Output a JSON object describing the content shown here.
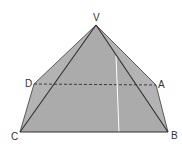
{
  "diagram": {
    "type": "pyramid-solid",
    "colors": {
      "fill": "#b3b3b3",
      "fill_dark": "#a8a8a8",
      "edge": "#3a3a3a",
      "highlight": "#ffffff"
    },
    "vertices": {
      "V": {
        "label": "V",
        "x": 96,
        "y": 25
      },
      "D": {
        "label": "D",
        "x": 34,
        "y": 84
      },
      "A": {
        "label": "A",
        "x": 156,
        "y": 85
      },
      "C": {
        "label": "C",
        "x": 20,
        "y": 132
      },
      "B": {
        "label": "B",
        "x": 168,
        "y": 132
      }
    },
    "labels": [
      {
        "text": "V",
        "x": 93,
        "y": 21
      },
      {
        "text": "D",
        "x": 25,
        "y": 87
      },
      {
        "text": "A",
        "x": 158,
        "y": 88
      },
      {
        "text": "C",
        "x": 11,
        "y": 140
      },
      {
        "text": "B",
        "x": 171,
        "y": 139
      }
    ],
    "edges": [
      "VD",
      "VA",
      "VC",
      "VB",
      "DC",
      "AB",
      "CB"
    ],
    "hidden_edges": [
      "DA"
    ]
  }
}
